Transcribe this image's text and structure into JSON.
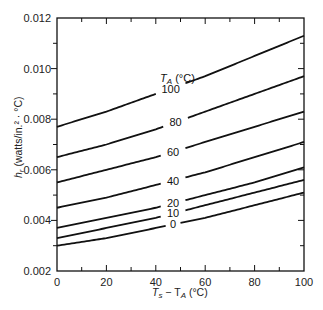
{
  "chart_data": {
    "type": "line",
    "title": "",
    "xlabel": "T_s − T_A (°C)",
    "ylabel": "h_r (watts/in.² · °C)",
    "legend_title": "T_A (°C)",
    "xlim": [
      0,
      100
    ],
    "ylim": [
      0.002,
      0.012
    ],
    "x_ticks": [
      0,
      20,
      40,
      60,
      80,
      100
    ],
    "x_tick_labels": [
      "0",
      "20",
      "40",
      "60",
      "80",
      "100"
    ],
    "y_ticks": [
      0.002,
      0.004,
      0.006,
      0.008,
      0.01,
      0.012
    ],
    "y_tick_labels": [
      "0.002",
      "0.004",
      "0.006",
      "0.008",
      "0.010",
      "0.012"
    ],
    "grid": false,
    "x": [
      0,
      20,
      40,
      60,
      80,
      100
    ],
    "series": [
      {
        "name": "100",
        "values": [
          0.0077,
          0.0083,
          0.009,
          0.0097,
          0.0105,
          0.0113
        ]
      },
      {
        "name": "80",
        "values": [
          0.0065,
          0.007,
          0.0076,
          0.0083,
          0.009,
          0.0097
        ]
      },
      {
        "name": "60",
        "values": [
          0.0055,
          0.006,
          0.0065,
          0.0071,
          0.0077,
          0.0083
        ]
      },
      {
        "name": "40",
        "values": [
          0.0045,
          0.0049,
          0.0054,
          0.0059,
          0.0065,
          0.0071
        ]
      },
      {
        "name": "20",
        "values": [
          0.0037,
          0.0041,
          0.0045,
          0.005,
          0.0055,
          0.0061
        ]
      },
      {
        "name": "10",
        "values": [
          0.0033,
          0.0037,
          0.0041,
          0.0046,
          0.0051,
          0.0056
        ]
      },
      {
        "name": "0",
        "values": [
          0.003,
          0.0033,
          0.0037,
          0.0041,
          0.0046,
          0.0051
        ]
      }
    ],
    "label_positions_x": [
      46,
      48,
      47,
      47,
      47,
      47,
      47
    ]
  },
  "labels": {
    "x_axis_main": "T",
    "x_axis_sub1": "s",
    "x_axis_minus": " − T",
    "x_axis_sub2": "A",
    "x_axis_unit": " (°C)",
    "y_axis_main": "h",
    "y_axis_sub": "r",
    "y_axis_unit": " (watts/in.² · °C)",
    "legend_main": "T",
    "legend_sub": "A",
    "legend_unit": " (°C)"
  }
}
